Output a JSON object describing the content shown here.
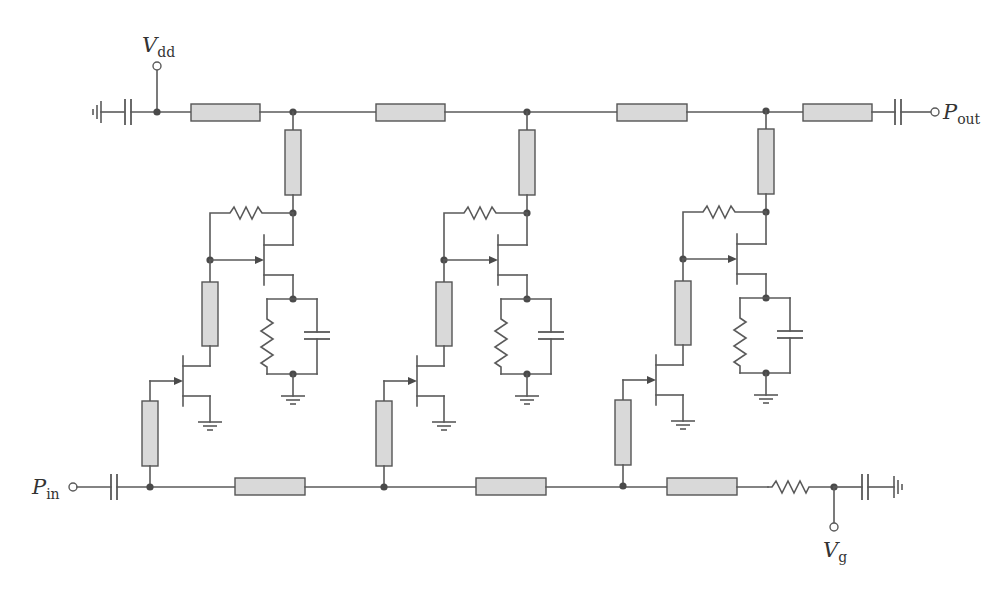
{
  "diagram": {
    "type": "circuit-schematic",
    "colors": {
      "wire": "#5a5a5a",
      "transmission_line_fill": "#d9d9d9",
      "node": "#4a4a4a",
      "background": "#ffffff"
    },
    "labels": {
      "vdd": {
        "main": "V",
        "sub": "dd"
      },
      "pout": {
        "main": "P",
        "sub": "out"
      },
      "pin": {
        "main": "P",
        "sub": "in"
      },
      "vg": {
        "main": "V",
        "sub": "g"
      }
    },
    "terminals": [
      {
        "id": "vdd-terminal",
        "label": "Vdd"
      },
      {
        "id": "pout-terminal",
        "label": "Pout"
      },
      {
        "id": "pin-terminal",
        "label": "Pin"
      },
      {
        "id": "vg-terminal",
        "label": "Vg"
      }
    ],
    "drain_line": {
      "transmission_lines": 4,
      "bypass_capacitor_to_ground": true,
      "output_dc_block": true
    },
    "gate_line": {
      "transmission_lines": 3,
      "termination_resistor": true,
      "bypass_capacitor_to_ground": true,
      "input_dc_block": true
    },
    "stages": [
      {
        "index": 1,
        "upper_fet": "common-gate with feedback resistor",
        "lower_fet": "common-source",
        "source_rc": "parallel R || C to ground"
      },
      {
        "index": 2,
        "upper_fet": "common-gate with feedback resistor",
        "lower_fet": "common-source",
        "source_rc": "parallel R || C to ground"
      },
      {
        "index": 3,
        "upper_fet": "common-gate with feedback resistor",
        "lower_fet": "common-source",
        "source_rc": "parallel R || C to ground"
      }
    ]
  }
}
